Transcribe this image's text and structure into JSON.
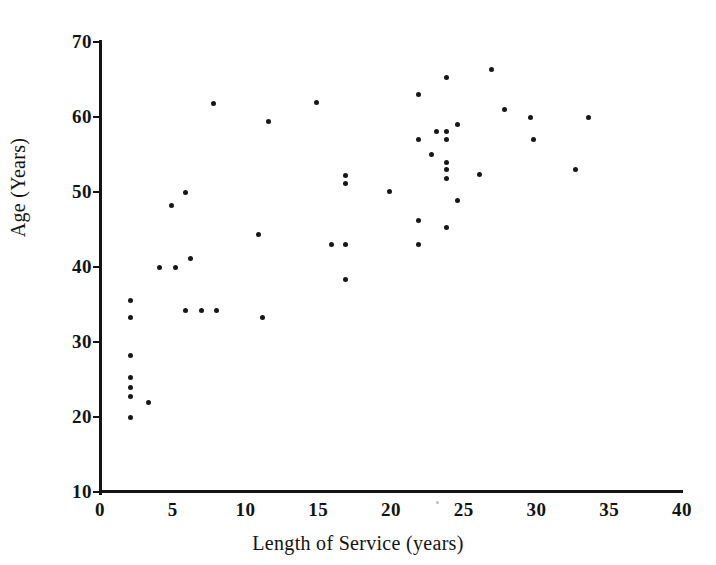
{
  "chart_data": {
    "type": "scatter",
    "title": "",
    "xlabel": "Length of Service (years)",
    "ylabel": "Age (Years)",
    "xlim": [
      0,
      40
    ],
    "ylim": [
      10,
      70
    ],
    "xticks": [
      0,
      5,
      10,
      15,
      20,
      25,
      30,
      35,
      40
    ],
    "yticks": [
      10,
      20,
      30,
      40,
      50,
      60,
      70
    ],
    "xtick_labels": [
      "0",
      "5",
      "10",
      "15",
      "20",
      "25",
      "30",
      "35",
      "40"
    ],
    "ytick_labels": [
      "10",
      "20",
      "30",
      "40",
      "50",
      "60",
      "70"
    ],
    "grid": false,
    "legend": null,
    "marker": "filled-circle",
    "marker_color": "#171717",
    "n_points": 56,
    "points": [
      {
        "x": 2.1,
        "y": 35.5
      },
      {
        "x": 2.1,
        "y": 33.3
      },
      {
        "x": 2.1,
        "y": 28.2
      },
      {
        "x": 2.1,
        "y": 25.3
      },
      {
        "x": 2.1,
        "y": 24.0
      },
      {
        "x": 2.1,
        "y": 22.8
      },
      {
        "x": 2.1,
        "y": 20.0
      },
      {
        "x": 3.3,
        "y": 21.9
      },
      {
        "x": 4.1,
        "y": 40.0
      },
      {
        "x": 4.9,
        "y": 48.2
      },
      {
        "x": 5.2,
        "y": 40.0
      },
      {
        "x": 5.9,
        "y": 50.0
      },
      {
        "x": 5.9,
        "y": 34.2
      },
      {
        "x": 6.2,
        "y": 41.2
      },
      {
        "x": 7.0,
        "y": 34.2
      },
      {
        "x": 8.0,
        "y": 34.2
      },
      {
        "x": 7.8,
        "y": 61.8
      },
      {
        "x": 10.9,
        "y": 44.4
      },
      {
        "x": 11.2,
        "y": 33.3
      },
      {
        "x": 11.6,
        "y": 59.4
      },
      {
        "x": 14.9,
        "y": 62.0
      },
      {
        "x": 15.9,
        "y": 43.0
      },
      {
        "x": 16.9,
        "y": 52.2
      },
      {
        "x": 16.9,
        "y": 51.2
      },
      {
        "x": 16.9,
        "y": 43.0
      },
      {
        "x": 16.9,
        "y": 38.4
      },
      {
        "x": 19.9,
        "y": 50.1
      },
      {
        "x": 21.9,
        "y": 63.0
      },
      {
        "x": 21.9,
        "y": 57.0
      },
      {
        "x": 21.9,
        "y": 46.2
      },
      {
        "x": 21.9,
        "y": 43.0
      },
      {
        "x": 22.8,
        "y": 55.0
      },
      {
        "x": 23.1,
        "y": 58.1
      },
      {
        "x": 23.8,
        "y": 65.3
      },
      {
        "x": 23.8,
        "y": 58.1
      },
      {
        "x": 23.8,
        "y": 57.0
      },
      {
        "x": 23.8,
        "y": 54.0
      },
      {
        "x": 23.8,
        "y": 53.0
      },
      {
        "x": 23.8,
        "y": 51.8
      },
      {
        "x": 23.8,
        "y": 45.3
      },
      {
        "x": 24.6,
        "y": 59.0
      },
      {
        "x": 24.6,
        "y": 48.9
      },
      {
        "x": 26.1,
        "y": 52.4
      },
      {
        "x": 26.9,
        "y": 66.4
      },
      {
        "x": 27.8,
        "y": 61.0
      },
      {
        "x": 29.6,
        "y": 60.0
      },
      {
        "x": 29.8,
        "y": 57.0
      },
      {
        "x": 32.7,
        "y": 53.0
      },
      {
        "x": 33.6,
        "y": 60.0
      }
    ]
  },
  "axes": {
    "x_title": "Length of Service (years)",
    "y_title": "Age (Years)"
  }
}
